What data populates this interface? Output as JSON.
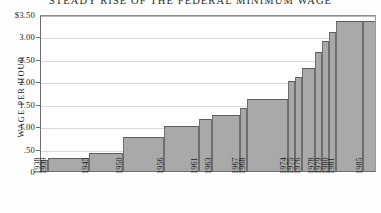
{
  "chart": {
    "title": "STEADY RISE OF THE FEDERAL MINIMUM WAGE",
    "ylabel": "WAGE PER HOUR",
    "colors": {
      "bar_fill": "#a9a9a9",
      "bar_edge": "#5d5d5d",
      "grid": "#d9d9d9",
      "axis": "#6f6f6f",
      "background": "#ffffff",
      "text": "#1b1b1b"
    }
  },
  "chart_data": {
    "type": "bar",
    "title": "STEADY RISE OF THE FEDERAL MINIMUM WAGE",
    "xlabel": "",
    "ylabel": "WAGE PER HOUR",
    "grid": true,
    "legend": "none",
    "ylim": [
      0,
      3.5
    ],
    "xlim": [
      1938,
      1987
    ],
    "ytick_labels": [
      "$3.50",
      "3.00",
      "2.50",
      "2.00",
      "1.50",
      "1.00",
      ".50",
      "0"
    ],
    "ytick_values": [
      3.5,
      3.0,
      2.5,
      2.0,
      1.5,
      1.0,
      0.5,
      0
    ],
    "categories": [
      "1938",
      "1939",
      "1945",
      "1950",
      "1956",
      "1961",
      "1963",
      "1967",
      "1968",
      "1974",
      "1975",
      "1976",
      "1978",
      "1979",
      "1980",
      "1981",
      "1985"
    ],
    "xtick_labels": [
      "1938",
      "1939",
      "1945",
      "1950",
      "1956",
      "1961",
      "1963",
      "1967",
      "1968",
      "1974",
      "1975",
      "1976",
      "1978",
      "1979",
      "1980",
      "1981",
      "1985"
    ],
    "values": [
      0.25,
      0.3,
      0.4,
      0.75,
      1.0,
      1.15,
      1.25,
      1.4,
      1.6,
      2.0,
      2.1,
      2.3,
      2.65,
      2.9,
      3.1,
      3.35,
      3.35
    ],
    "bars": [
      {
        "year": 1938,
        "label": "1938",
        "value": 0.25,
        "start": 1938,
        "end": 1939
      },
      {
        "year": 1939,
        "label": "1939",
        "value": 0.3,
        "start": 1939,
        "end": 1945
      },
      {
        "year": 1945,
        "label": "1945",
        "value": 0.4,
        "start": 1945,
        "end": 1950
      },
      {
        "year": 1950,
        "label": "1950",
        "value": 0.75,
        "start": 1950,
        "end": 1956
      },
      {
        "year": 1956,
        "label": "1956",
        "value": 1.0,
        "start": 1956,
        "end": 1961
      },
      {
        "year": 1961,
        "label": "1961",
        "value": 1.15,
        "start": 1961,
        "end": 1963
      },
      {
        "year": 1963,
        "label": "1963",
        "value": 1.25,
        "start": 1963,
        "end": 1967
      },
      {
        "year": 1967,
        "label": "1967",
        "value": 1.4,
        "start": 1967,
        "end": 1968
      },
      {
        "year": 1968,
        "label": "1968",
        "value": 1.6,
        "start": 1968,
        "end": 1974
      },
      {
        "year": 1974,
        "label": "1974",
        "value": 2.0,
        "start": 1974,
        "end": 1975
      },
      {
        "year": 1975,
        "label": "1975",
        "value": 2.1,
        "start": 1975,
        "end": 1976
      },
      {
        "year": 1976,
        "label": "1976",
        "value": 2.3,
        "start": 1976,
        "end": 1978
      },
      {
        "year": 1978,
        "label": "1978",
        "value": 2.65,
        "start": 1978,
        "end": 1979
      },
      {
        "year": 1979,
        "label": "1979",
        "value": 2.9,
        "start": 1979,
        "end": 1980
      },
      {
        "year": 1980,
        "label": "1980",
        "value": 3.1,
        "start": 1980,
        "end": 1981
      },
      {
        "year": 1981,
        "label": "1981",
        "value": 3.35,
        "start": 1981,
        "end": 1985
      },
      {
        "year": 1985,
        "label": "1985",
        "value": 3.35,
        "start": 1985,
        "end": 1987
      }
    ]
  }
}
